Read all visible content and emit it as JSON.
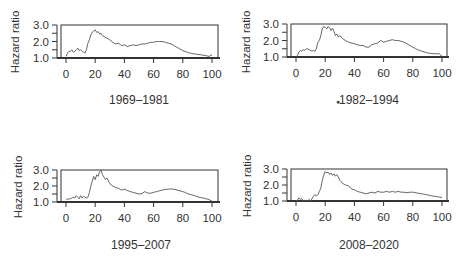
{
  "chart_data": [
    {
      "type": "line",
      "title": "1969–1981",
      "xlabel": "1969–1981",
      "ylabel": "Hazard ratio",
      "xlim": [
        0,
        100
      ],
      "ylim": [
        1.0,
        3.0
      ],
      "x_ticks": [
        "0",
        "20",
        "40",
        "60",
        "80",
        "100"
      ],
      "y_ticks": [
        "1.0",
        "2.0",
        "3.0"
      ],
      "grid": false,
      "series": [
        {
          "name": "hazard",
          "x": [
            0,
            1,
            2,
            3,
            4,
            5,
            6,
            7,
            8,
            9,
            10,
            11,
            12,
            13,
            14,
            15,
            16,
            17,
            18,
            19,
            20,
            21,
            22,
            23,
            24,
            25,
            26,
            28,
            30,
            32,
            34,
            36,
            38,
            40,
            42,
            44,
            46,
            48,
            50,
            52,
            54,
            56,
            58,
            60,
            62,
            64,
            66,
            68,
            70,
            72,
            74,
            76,
            78,
            80,
            82,
            84,
            86,
            88,
            90,
            92,
            94,
            96,
            98,
            100
          ],
          "values": [
            1.1,
            1.3,
            1.4,
            1.4,
            1.5,
            1.35,
            1.4,
            1.5,
            1.6,
            1.45,
            1.5,
            1.4,
            1.35,
            1.3,
            1.5,
            1.9,
            2.1,
            2.4,
            2.55,
            2.65,
            2.7,
            2.55,
            2.6,
            2.45,
            2.5,
            2.35,
            2.3,
            2.2,
            2.1,
            1.95,
            1.85,
            1.9,
            1.75,
            1.8,
            1.7,
            1.75,
            1.8,
            1.75,
            1.8,
            1.85,
            1.85,
            1.9,
            1.95,
            1.95,
            2.0,
            2.0,
            2.0,
            1.95,
            1.9,
            1.85,
            1.75,
            1.65,
            1.55,
            1.45,
            1.38,
            1.32,
            1.28,
            1.25,
            1.22,
            1.2,
            1.17,
            1.14,
            1.1,
            1.2
          ]
        }
      ]
    },
    {
      "type": "line",
      "title": "1982–1994",
      "xlabel": "1982–1994",
      "ylabel": "Hazard ratio",
      "xlim": [
        0,
        100
      ],
      "ylim": [
        1.0,
        3.0
      ],
      "x_ticks": [
        "0",
        "20",
        "40",
        "60",
        "80",
        "100"
      ],
      "y_ticks": [
        "1.0",
        "2.0",
        "3.0"
      ],
      "grid": false,
      "series": [
        {
          "name": "hazard",
          "x": [
            0,
            1,
            2,
            3,
            4,
            5,
            6,
            7,
            8,
            9,
            10,
            11,
            12,
            13,
            14,
            15,
            16,
            17,
            18,
            19,
            20,
            21,
            22,
            23,
            24,
            25,
            26,
            27,
            28,
            29,
            30,
            32,
            34,
            36,
            38,
            40,
            42,
            44,
            46,
            48,
            50,
            52,
            54,
            56,
            58,
            60,
            62,
            64,
            66,
            68,
            70,
            72,
            74,
            76,
            78,
            80,
            82,
            84,
            86,
            88,
            90,
            92,
            94,
            96,
            98,
            100
          ],
          "values": [
            1.0,
            1.1,
            1.3,
            1.4,
            1.35,
            1.45,
            1.4,
            1.5,
            1.5,
            1.45,
            1.4,
            1.35,
            1.4,
            1.35,
            1.5,
            1.9,
            2.0,
            2.3,
            2.7,
            2.85,
            2.8,
            2.7,
            2.85,
            2.75,
            2.6,
            2.75,
            2.55,
            2.3,
            2.4,
            2.2,
            2.3,
            2.1,
            2.0,
            1.9,
            1.85,
            1.8,
            1.75,
            1.7,
            1.7,
            1.6,
            1.6,
            1.75,
            1.8,
            1.85,
            2.0,
            1.9,
            1.95,
            2.0,
            2.05,
            2.0,
            2.0,
            1.95,
            1.9,
            1.8,
            1.7,
            1.6,
            1.5,
            1.42,
            1.35,
            1.3,
            1.25,
            1.22,
            1.2,
            1.2,
            1.2,
            1.05
          ]
        }
      ]
    },
    {
      "type": "line",
      "title": "1995–2007",
      "xlabel": "1995–2007",
      "ylabel": "Hazard ratio",
      "xlim": [
        0,
        100
      ],
      "ylim": [
        1.0,
        3.0
      ],
      "x_ticks": [
        "0",
        "20",
        "40",
        "60",
        "80",
        "100"
      ],
      "y_ticks": [
        "1.0",
        "2.0",
        "3.0"
      ],
      "grid": false,
      "series": [
        {
          "name": "hazard",
          "x": [
            0,
            1,
            2,
            3,
            4,
            5,
            6,
            7,
            8,
            9,
            10,
            11,
            12,
            13,
            14,
            15,
            16,
            17,
            18,
            19,
            20,
            21,
            22,
            23,
            24,
            25,
            26,
            27,
            28,
            30,
            32,
            34,
            36,
            38,
            40,
            42,
            44,
            46,
            48,
            50,
            52,
            54,
            56,
            58,
            60,
            62,
            64,
            66,
            68,
            70,
            72,
            74,
            76,
            78,
            80,
            82,
            84,
            86,
            88,
            90,
            92,
            94,
            96,
            98,
            100
          ],
          "values": [
            1.2,
            1.15,
            1.2,
            1.2,
            1.25,
            1.3,
            1.25,
            1.4,
            1.3,
            1.2,
            1.4,
            1.25,
            1.35,
            1.3,
            1.25,
            1.3,
            1.6,
            2.0,
            2.3,
            2.6,
            2.4,
            2.7,
            2.6,
            2.9,
            3.0,
            2.7,
            2.55,
            2.4,
            2.5,
            2.15,
            2.0,
            1.9,
            1.85,
            1.75,
            1.8,
            1.72,
            1.65,
            1.6,
            1.55,
            1.5,
            1.52,
            1.65,
            1.55,
            1.55,
            1.6,
            1.65,
            1.7,
            1.75,
            1.78,
            1.8,
            1.82,
            1.8,
            1.75,
            1.7,
            1.65,
            1.58,
            1.5,
            1.45,
            1.4,
            1.33,
            1.28,
            1.25,
            1.2,
            1.15,
            1.05
          ]
        }
      ]
    },
    {
      "type": "line",
      "title": "2008–2020",
      "xlabel": "2008–2020",
      "ylabel": "Hazard ratio",
      "xlim": [
        0,
        100
      ],
      "ylim": [
        1.0,
        3.0
      ],
      "x_ticks": [
        "0",
        "20",
        "40",
        "60",
        "80",
        "100"
      ],
      "y_ticks": [
        "1.0",
        "2.0",
        "3.0"
      ],
      "grid": false,
      "series": [
        {
          "name": "hazard",
          "x": [
            0,
            1,
            2,
            3,
            4,
            5,
            6,
            7,
            8,
            9,
            10,
            11,
            12,
            13,
            14,
            15,
            16,
            17,
            18,
            19,
            20,
            21,
            22,
            23,
            24,
            25,
            26,
            27,
            28,
            29,
            30,
            32,
            34,
            36,
            38,
            40,
            42,
            44,
            46,
            48,
            50,
            52,
            54,
            56,
            58,
            60,
            62,
            64,
            66,
            68,
            70,
            72,
            74,
            76,
            78,
            80,
            82,
            84,
            86,
            88,
            90,
            92,
            94,
            96,
            98,
            100
          ],
          "values": [
            1.0,
            1.05,
            1.2,
            1.1,
            1.15,
            1.0,
            1.05,
            1.0,
            1.0,
            1.1,
            1.0,
            1.15,
            1.3,
            1.4,
            1.3,
            1.4,
            1.6,
            1.8,
            2.3,
            2.6,
            2.85,
            2.75,
            2.8,
            2.65,
            2.75,
            2.6,
            2.7,
            2.55,
            2.65,
            2.5,
            2.3,
            2.1,
            2.0,
            1.95,
            1.75,
            1.7,
            1.6,
            1.55,
            1.5,
            1.45,
            1.5,
            1.55,
            1.5,
            1.6,
            1.55,
            1.55,
            1.6,
            1.55,
            1.6,
            1.55,
            1.6,
            1.55,
            1.55,
            1.52,
            1.55,
            1.55,
            1.52,
            1.48,
            1.45,
            1.42,
            1.38,
            1.35,
            1.3,
            1.28,
            1.25,
            1.22
          ]
        }
      ]
    }
  ],
  "panels": [
    {
      "title": "1969–1981",
      "ylabel": "Hazard ratio"
    },
    {
      "title": "1982–1994",
      "ylabel": "Hazard ratio"
    },
    {
      "title": "1995–2007",
      "ylabel": "Hazard ratio"
    },
    {
      "title": "2008–2020",
      "ylabel": "Hazard ratio"
    }
  ],
  "style": {
    "line_color": "#555555",
    "axis_color": "#333333"
  }
}
